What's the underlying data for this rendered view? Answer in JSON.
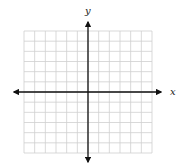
{
  "diagram": {
    "type": "coordinate-plane",
    "grid": {
      "columns": 12,
      "rows": 12,
      "left": 24,
      "top": 31,
      "right": 152,
      "bottom": 153,
      "line_color": "#cfcfcf"
    },
    "axes": {
      "color": "#111111",
      "x_axis": {
        "label": "x",
        "y": 92,
        "from": 14,
        "to": 161
      },
      "y_axis": {
        "label": "y",
        "x": 88,
        "from": 22,
        "to": 162
      }
    }
  }
}
